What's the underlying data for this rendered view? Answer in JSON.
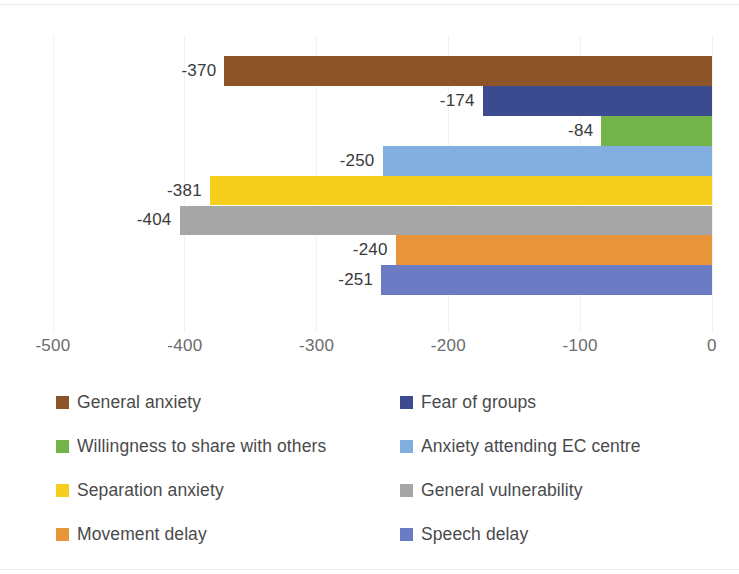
{
  "chart_data": {
    "type": "bar",
    "orientation": "horizontal",
    "title": "",
    "subtitle": "",
    "xlabel": "",
    "ylabel": "",
    "xlim": [
      -500,
      0
    ],
    "ylim": null,
    "grid": true,
    "grid_axis": "x",
    "legend_position": "bottom",
    "legend_columns": 2,
    "x_ticks": [
      -500,
      -400,
      -300,
      -200,
      -100,
      0
    ],
    "x_tick_labels": [
      "-500",
      "-400",
      "-300",
      "-200",
      "-100",
      "0"
    ],
    "categories": [
      "General anxiety",
      "Fear of groups",
      "Willingness to share with others",
      "Anxiety attending EC centre",
      "Separation anxiety",
      "General vulnerability",
      "Movement delay",
      "Speech delay"
    ],
    "values": [
      -370,
      -174,
      -84,
      -250,
      -381,
      -404,
      -240,
      -251
    ],
    "data_labels": [
      "-370",
      "-174",
      "-84",
      "-250",
      "-381",
      "-404",
      "-240",
      "-251"
    ],
    "colors": [
      "#8C5428",
      "#3C4B8F",
      "#72B34A",
      "#82AEE0",
      "#F5CE1E",
      "#A6A6A6",
      "#E8943B",
      "#6B7CC4"
    ],
    "series": [
      {
        "name": "General anxiety",
        "value": -370,
        "label": "-370",
        "color": "#8C5428"
      },
      {
        "name": "Fear of groups",
        "value": -174,
        "label": "-174",
        "color": "#3C4B8F"
      },
      {
        "name": "Willingness to share with others",
        "value": -84,
        "label": "-84",
        "color": "#72B34A"
      },
      {
        "name": "Anxiety attending EC centre",
        "value": -250,
        "label": "-250",
        "color": "#82AEE0"
      },
      {
        "name": "Separation anxiety",
        "value": -381,
        "label": "-381",
        "color": "#F5CE1E"
      },
      {
        "name": "General vulnerability",
        "value": -404,
        "label": "-404",
        "color": "#A6A6A6"
      },
      {
        "name": "Movement delay",
        "value": -240,
        "label": "-240",
        "color": "#E8943B"
      },
      {
        "name": "Speech delay",
        "value": -251,
        "label": "-251",
        "color": "#6B7CC4"
      }
    ]
  },
  "legend": {
    "entries": [
      {
        "label": "General anxiety",
        "color": "#8C5428"
      },
      {
        "label": "Fear of groups",
        "color": "#3C4B8F"
      },
      {
        "label": "Willingness to share with others",
        "color": "#72B34A"
      },
      {
        "label": "Anxiety attending EC centre",
        "color": "#82AEE0"
      },
      {
        "label": "Separation anxiety",
        "color": "#F5CE1E"
      },
      {
        "label": "General vulnerability",
        "color": "#A6A6A6"
      },
      {
        "label": "Movement delay",
        "color": "#E8943B"
      },
      {
        "label": "Speech delay",
        "color": "#6B7CC4"
      }
    ]
  },
  "style": {
    "background": "#ffffff",
    "gridline_color": "#f2f2f2",
    "tick_label_color": "#6b6b6d",
    "data_label_color": "#3a3a3c",
    "legend_label_color": "#4a4a4c"
  }
}
